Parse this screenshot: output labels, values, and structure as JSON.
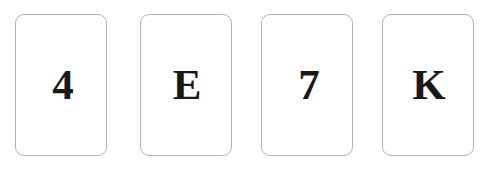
{
  "scene": {
    "name": "wason-selection-task-cards",
    "background_color": "#ffffff",
    "card_face_color": "#ffffff",
    "card_border_color": "#b2b4b6",
    "glyph_color": "#17191b"
  },
  "cards": [
    {
      "id": "card-1",
      "face": "4",
      "face_type": "digit",
      "name": "card-four"
    },
    {
      "id": "card-2",
      "face": "E",
      "face_type": "letter",
      "name": "card-e"
    },
    {
      "id": "card-3",
      "face": "7",
      "face_type": "digit",
      "name": "card-seven"
    },
    {
      "id": "card-4",
      "face": "K",
      "face_type": "letter",
      "name": "card-k"
    }
  ]
}
